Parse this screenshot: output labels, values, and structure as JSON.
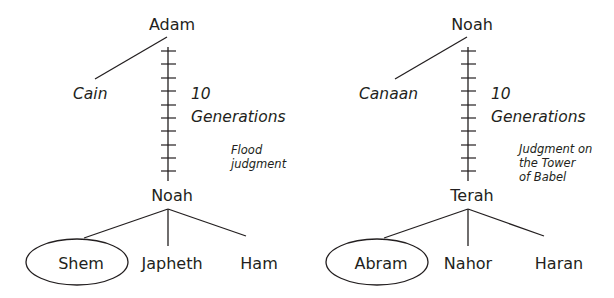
{
  "left_tree": {
    "root": "Adam",
    "side_branch": "Cain",
    "span_number": "10",
    "span_label": "Generations",
    "judgment": [
      "Flood",
      "judgment"
    ],
    "descendant": "Noah",
    "children": [
      "Shem",
      "Japheth",
      "Ham"
    ],
    "highlighted_child": "Shem",
    "generation_ticks": 11
  },
  "right_tree": {
    "root": "Noah",
    "side_branch": "Canaan",
    "span_number": "10",
    "span_label": "Generations",
    "judgment": [
      "Judgment on",
      "the Tower",
      "of Babel"
    ],
    "descendant": "Terah",
    "children": [
      "Abram",
      "Nahor",
      "Haran"
    ],
    "highlighted_child": "Abram",
    "generation_ticks": 11
  },
  "colors": {
    "ink": "#231f20",
    "background": "#ffffff"
  }
}
